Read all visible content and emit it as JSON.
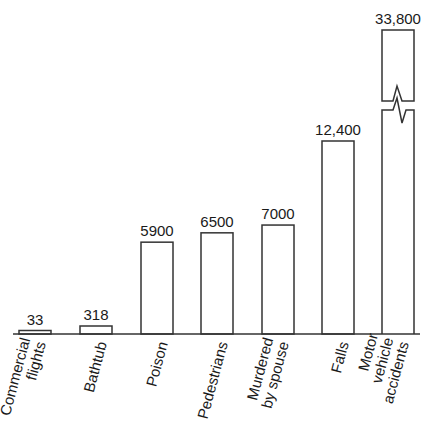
{
  "chart_data": {
    "type": "bar",
    "title": "",
    "xlabel": "",
    "ylabel": "",
    "grid": false,
    "categories": [
      "Commercial flights",
      "Bathtub",
      "Poison",
      "Pedestrians",
      "Murdered by spouse",
      "Falls",
      "Motor vehicle accidents"
    ],
    "category_lines": [
      [
        "Commercial",
        "flights"
      ],
      [
        "Bathtub"
      ],
      [
        "Poison"
      ],
      [
        "Pedestrians"
      ],
      [
        "Murdered",
        "by spouse"
      ],
      [
        "Falls"
      ],
      [
        "Motor",
        "vehicle",
        "accidents"
      ]
    ],
    "values": [
      33,
      318,
      5900,
      6500,
      7000,
      12400,
      33800
    ],
    "value_labels": [
      "33",
      "318",
      "5900",
      "6500",
      "7000",
      "12,400",
      "33,800"
    ],
    "annotations": [
      "Broken axis marker on 'Motor vehicle accidents' bar (bar truncated)"
    ],
    "style": {
      "bar_fill": "#ffffff",
      "bar_stroke": "#333333",
      "axis_color": "#333333"
    }
  }
}
